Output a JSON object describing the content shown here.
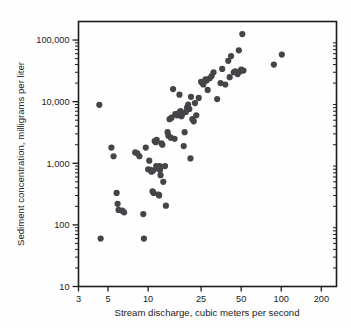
{
  "chart_data": {
    "type": "scatter",
    "title": "",
    "xlabel": "Stream discharge, cubic meters per second",
    "ylabel": "Sediment concentration, milligrams per liter",
    "xscale": "log",
    "yscale": "log",
    "xlim": [
      3,
      260
    ],
    "ylim": [
      10,
      200000
    ],
    "grid": false,
    "legend": null,
    "xticks": [
      3,
      5,
      10,
      25,
      50,
      100,
      200
    ],
    "xticklabels": [
      "3",
      "5",
      "10",
      "25",
      "50",
      "100",
      "200"
    ],
    "yticks": [
      10,
      100,
      1000,
      10000,
      100000
    ],
    "yticklabels": [
      "10",
      "100",
      "1,000",
      "10,000",
      "100,000"
    ],
    "minor_ticks": true,
    "marker": "circle",
    "marker_color": "#454549",
    "marker_size": 3.1,
    "points": [
      [
        4.3,
        8900
      ],
      [
        4.4,
        60
      ],
      [
        5.3,
        1800
      ],
      [
        5.5,
        1300
      ],
      [
        5.8,
        330
      ],
      [
        5.9,
        220
      ],
      [
        6.0,
        175
      ],
      [
        6.4,
        170
      ],
      [
        6.6,
        160
      ],
      [
        8.0,
        1500
      ],
      [
        8.3,
        1450
      ],
      [
        8.6,
        1300
      ],
      [
        9.2,
        150
      ],
      [
        9.3,
        60
      ],
      [
        9.6,
        1800
      ],
      [
        10.0,
        800
      ],
      [
        10.2,
        1100
      ],
      [
        10.4,
        780
      ],
      [
        10.6,
        730
      ],
      [
        10.8,
        350
      ],
      [
        10.9,
        760
      ],
      [
        11.0,
        330
      ],
      [
        11.2,
        2300
      ],
      [
        11.4,
        2200
      ],
      [
        11.5,
        900
      ],
      [
        11.6,
        2400
      ],
      [
        11.8,
        860
      ],
      [
        11.9,
        820
      ],
      [
        12.0,
        310
      ],
      [
        12.1,
        300
      ],
      [
        12.2,
        900
      ],
      [
        12.3,
        780
      ],
      [
        12.4,
        640
      ],
      [
        12.6,
        2100
      ],
      [
        12.8,
        2000
      ],
      [
        13.0,
        500
      ],
      [
        13.4,
        900
      ],
      [
        13.6,
        205
      ],
      [
        14.0,
        3200
      ],
      [
        14.2,
        2800
      ],
      [
        14.5,
        5200
      ],
      [
        14.8,
        2600
      ],
      [
        15.0,
        5500
      ],
      [
        15.4,
        16000
      ],
      [
        15.8,
        2500
      ],
      [
        16.0,
        6300
      ],
      [
        16.5,
        6000
      ],
      [
        17.0,
        6500
      ],
      [
        17.2,
        13000
      ],
      [
        17.5,
        7000
      ],
      [
        17.8,
        5800
      ],
      [
        18.0,
        6200
      ],
      [
        18.5,
        1900
      ],
      [
        18.8,
        3200
      ],
      [
        19.2,
        6800
      ],
      [
        19.6,
        8000
      ],
      [
        20.0,
        9000
      ],
      [
        20.4,
        7600
      ],
      [
        20.8,
        1200
      ],
      [
        21.0,
        12000
      ],
      [
        21.5,
        5200
      ],
      [
        22.0,
        4800
      ],
      [
        22.5,
        9500
      ],
      [
        23.0,
        6000
      ],
      [
        24.0,
        11500
      ],
      [
        25.0,
        21000
      ],
      [
        25.5,
        20000
      ],
      [
        26.0,
        19000
      ],
      [
        27.0,
        23000
      ],
      [
        27.5,
        22000
      ],
      [
        28.0,
        15500
      ],
      [
        29.0,
        24000
      ],
      [
        30.0,
        26000
      ],
      [
        31.0,
        30000
      ],
      [
        33.0,
        11000
      ],
      [
        35.0,
        20000
      ],
      [
        36.0,
        34000
      ],
      [
        38.0,
        19000
      ],
      [
        40.0,
        46000
      ],
      [
        41.0,
        25000
      ],
      [
        42.0,
        55000
      ],
      [
        44.0,
        30000
      ],
      [
        45.0,
        31000
      ],
      [
        47.0,
        28000
      ],
      [
        48.0,
        68000
      ],
      [
        49.0,
        31000
      ],
      [
        50.0,
        33000
      ],
      [
        51.0,
        125000
      ],
      [
        52.0,
        32000
      ],
      [
        88.0,
        40000
      ],
      [
        101.0,
        58000
      ]
    ]
  },
  "figure": {
    "background_color": "#fefefe",
    "axis_color": "#1d1d1d",
    "text_color": "#1b1b1b"
  }
}
